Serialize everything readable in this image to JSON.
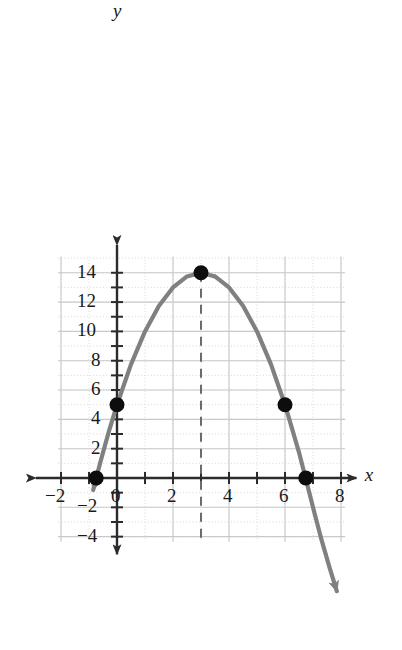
{
  "chart_data": {
    "type": "line",
    "title": "",
    "subtitle": "",
    "xlabel": "x",
    "ylabel": "y",
    "xlim": [
      -2.6,
      8.8
    ],
    "ylim": [
      -4.6,
      15.6
    ],
    "grid": true,
    "grid_minor_step": 1,
    "grid_major_step": 2,
    "legend": null,
    "curve": {
      "name": "parabola",
      "equation": "y = -x^2 + 6x + 5",
      "color": "#808080",
      "opens": "down",
      "vertex": [
        3,
        14
      ],
      "y_intercept": [
        0,
        5
      ],
      "x_intercepts": [
        -0.742,
        6.742
      ],
      "x": [
        -0.85,
        -0.6,
        -0.3,
        0,
        0.5,
        1,
        1.5,
        2,
        2.5,
        3,
        3.5,
        4,
        4.5,
        5,
        5.5,
        6,
        6.5,
        7,
        7.3,
        7.6,
        7.85
      ],
      "y": [
        -0.82,
        1.04,
        3.11,
        5,
        7.75,
        10,
        11.75,
        13,
        13.75,
        14,
        13.75,
        13,
        11.75,
        10,
        7.75,
        5,
        1.75,
        -2,
        -4.19,
        -6.16,
        -7.72
      ]
    },
    "points": [
      {
        "label": "left-x-intercept",
        "x": -0.742,
        "y": 0
      },
      {
        "label": "y-intercept",
        "x": 0,
        "y": 5
      },
      {
        "label": "vertex",
        "x": 3,
        "y": 14
      },
      {
        "label": "symmetric-point",
        "x": 6,
        "y": 5
      },
      {
        "label": "right-x-intercept",
        "x": 6.742,
        "y": 0
      }
    ],
    "axis_of_symmetry": {
      "x": 3,
      "style": "dashed",
      "color": "#6b6b6b",
      "y_from": -4.2,
      "y_to": 14
    },
    "x_ticks": [
      -2,
      0,
      2,
      4,
      6,
      8
    ],
    "x_tick_labels": [
      "−2",
      "0",
      "2",
      "4",
      "6",
      "8"
    ],
    "y_ticks": [
      -4,
      -2,
      2,
      4,
      6,
      8,
      10,
      12,
      14
    ],
    "y_tick_labels": [
      "−4",
      "−2",
      "2",
      "4",
      "6",
      "8",
      "10",
      "12",
      "14"
    ],
    "x_minor_ticks": [
      -1,
      1,
      3,
      5,
      7
    ],
    "y_minor_ticks": [
      -3,
      -1,
      1,
      3,
      5,
      7,
      9,
      11,
      13
    ],
    "arrows": {
      "x_axis": [
        "left",
        "right"
      ],
      "y_axis": [
        "up",
        "down"
      ],
      "curve": [
        "lower-left",
        "lower-right"
      ]
    }
  },
  "colors": {
    "curve": "#808080",
    "axis": "#2b2b2b",
    "point": "#0d0d0d",
    "grid_minor": "#d8d8d8",
    "grid_major": "#c9c9c9",
    "dash": "#6b6b6b",
    "text": "#1a1a1a",
    "background": "#ffffff"
  }
}
